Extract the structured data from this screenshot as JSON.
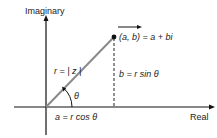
{
  "axes": {
    "y_label": "Imaginary",
    "x_label": "Real"
  },
  "point": {
    "label": "(a, b) = a + bi"
  },
  "annotations": {
    "radius": "r = | z |",
    "angle": "θ",
    "real_part": "a = r cos θ",
    "imag_part": "b = r sin θ"
  },
  "colors": {
    "axis": "#111111",
    "vector": "#8a8a8a",
    "text": "#1a1a1a"
  }
}
